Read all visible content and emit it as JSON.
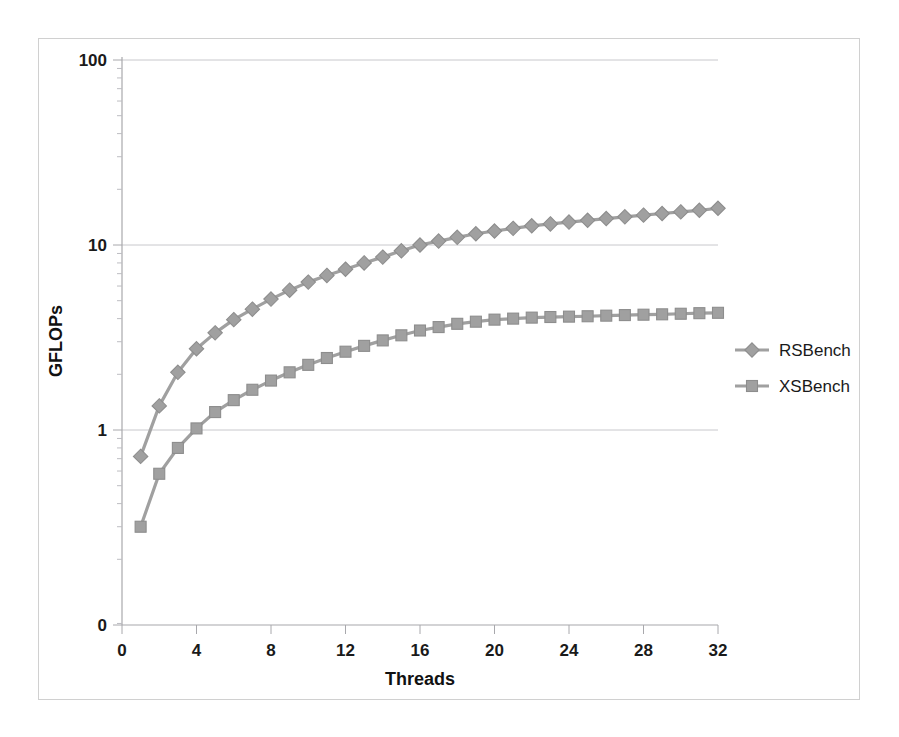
{
  "chart_data": {
    "type": "line",
    "title": "",
    "xlabel": "Threads",
    "ylabel": "GFLOPs",
    "xlim": [
      0,
      32
    ],
    "ylim": [
      0.1,
      100
    ],
    "yscale": "log",
    "xscale": "linear",
    "grid": true,
    "legend_position": "right",
    "x_ticks": [
      0,
      4,
      8,
      12,
      16,
      20,
      24,
      28,
      32
    ],
    "x_tick_labels": [
      "0",
      "4",
      "8",
      "12",
      "16",
      "20",
      "24",
      "28",
      "32"
    ],
    "y_ticks": [
      1,
      10,
      100
    ],
    "y_tick_labels": [
      "0",
      "1",
      "10",
      "100"
    ],
    "y_axis_origin_label": "0",
    "x": [
      1,
      2,
      3,
      4,
      5,
      6,
      7,
      8,
      9,
      10,
      11,
      12,
      13,
      14,
      15,
      16,
      17,
      18,
      19,
      20,
      21,
      22,
      23,
      24,
      25,
      26,
      27,
      28,
      29,
      30,
      31,
      32
    ],
    "series": [
      {
        "name": "RSBench",
        "color": "#a0a0a0",
        "marker": "diamond",
        "values": [
          0.72,
          1.35,
          2.05,
          2.75,
          3.35,
          3.95,
          4.5,
          5.1,
          5.7,
          6.3,
          6.85,
          7.4,
          8.0,
          8.6,
          9.3,
          10.0,
          10.5,
          11.0,
          11.5,
          11.9,
          12.3,
          12.7,
          13.0,
          13.3,
          13.6,
          13.9,
          14.2,
          14.5,
          14.8,
          15.1,
          15.4,
          15.8
        ]
      },
      {
        "name": "XSBench",
        "color": "#a0a0a0",
        "marker": "square",
        "values": [
          0.3,
          0.58,
          0.8,
          1.02,
          1.25,
          1.45,
          1.65,
          1.85,
          2.05,
          2.25,
          2.45,
          2.65,
          2.85,
          3.05,
          3.25,
          3.45,
          3.6,
          3.75,
          3.85,
          3.95,
          4.0,
          4.05,
          4.08,
          4.1,
          4.12,
          4.15,
          4.18,
          4.2,
          4.22,
          4.25,
          4.28,
          4.3
        ]
      }
    ]
  },
  "legend": {
    "entries": [
      {
        "label": "RSBench"
      },
      {
        "label": "XSBench"
      }
    ]
  },
  "axes": {
    "x_title": "Threads",
    "y_title": "GFLOPs"
  }
}
